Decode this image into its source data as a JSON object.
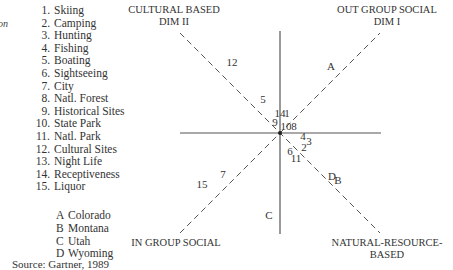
{
  "chart_data": {
    "type": "scatter",
    "title": "",
    "axes": {
      "dim1": {
        "label": "DIM I",
        "positive_end": "OUT GROUP SOCIAL",
        "negative_end": "IN GROUP SOCIAL"
      },
      "dim2": {
        "label": "DIM II",
        "positive_end": "CULTURAL BASED",
        "negative_end": "NATURAL-RESOURCE-BASED"
      }
    },
    "corner_labels": {
      "top_left": [
        "CULTURAL BASED",
        "DIM II"
      ],
      "top_right": [
        "OUT GROUP SOCIAL",
        "DIM I"
      ],
      "bottom_left": [
        "IN GROUP SOCIAL"
      ],
      "bottom_right": [
        "NATURAL-RESOURCE-",
        "BASED"
      ]
    },
    "grid": false,
    "xlim": [
      -1,
      1
    ],
    "ylim": [
      -1,
      1
    ],
    "attributes": [
      {
        "id": "1",
        "label": "Skiing",
        "x": 0.07,
        "y": 0.16
      },
      {
        "id": "2",
        "label": "Camping",
        "x": 0.24,
        "y": -0.18
      },
      {
        "id": "3",
        "label": "Hunting",
        "x": 0.29,
        "y": -0.12
      },
      {
        "id": "4",
        "label": "Fishing",
        "x": 0.23,
        "y": -0.07
      },
      {
        "id": "5",
        "label": "Boating",
        "x": -0.17,
        "y": 0.3
      },
      {
        "id": "6",
        "label": "Sightseeing",
        "x": 0.1,
        "y": -0.22
      },
      {
        "id": "7",
        "label": "City",
        "x": -0.57,
        "y": -0.45
      },
      {
        "id": "8",
        "label": "Natl. Forest",
        "x": 0.14,
        "y": 0.03
      },
      {
        "id": "9",
        "label": "Historical Sites",
        "x": -0.05,
        "y": 0.07
      },
      {
        "id": "10",
        "label": "State Park",
        "x": 0.06,
        "y": 0.03
      },
      {
        "id": "11",
        "label": "Natl. Park",
        "x": 0.16,
        "y": -0.29
      },
      {
        "id": "12",
        "label": "Cultural Sites",
        "x": -0.48,
        "y": 0.67
      },
      {
        "id": "13",
        "label": "Night Life",
        "x": null,
        "y": null
      },
      {
        "id": "14",
        "label": "Receptiveness",
        "x": 0.0,
        "y": 0.16
      },
      {
        "id": "15",
        "label": "Liquor",
        "x": -0.78,
        "y": -0.55
      }
    ],
    "states": [
      {
        "id": "A",
        "label": "Colorado",
        "x": 0.51,
        "y": 0.63
      },
      {
        "id": "B",
        "label": "Montana",
        "x": 0.58,
        "y": -0.51
      },
      {
        "id": "C",
        "label": "Utah",
        "x": -0.11,
        "y": -0.86
      },
      {
        "id": "D",
        "label": "Wyoming",
        "x": 0.52,
        "y": -0.47
      }
    ],
    "source": "Source: Gartner, 1989"
  },
  "legend": {
    "cut_label": "on",
    "attributes": [
      {
        "num": "1.",
        "label": "Skiing"
      },
      {
        "num": "2.",
        "label": "Camping"
      },
      {
        "num": "3.",
        "label": "Hunting"
      },
      {
        "num": "4.",
        "label": "Fishing"
      },
      {
        "num": "5.",
        "label": "Boating"
      },
      {
        "num": "6.",
        "label": "Sightseeing"
      },
      {
        "num": "7.",
        "label": "City"
      },
      {
        "num": "8.",
        "label": "Natl. Forest"
      },
      {
        "num": "9.",
        "label": "Historical Sites"
      },
      {
        "num": "10.",
        "label": "State Park"
      },
      {
        "num": "11.",
        "label": "Natl. Park"
      },
      {
        "num": "12.",
        "label": "Cultural Sites"
      },
      {
        "num": "13.",
        "label": "Night Life"
      },
      {
        "num": "14.",
        "label": "Receptiveness"
      },
      {
        "num": "15.",
        "label": "Liquor"
      }
    ],
    "states": [
      {
        "code": "A",
        "label": "Colorado"
      },
      {
        "code": "B",
        "label": "Montana"
      },
      {
        "code": "C",
        "label": "Utah"
      },
      {
        "code": "D",
        "label": "Wyoming"
      }
    ]
  },
  "source": "Source: Gartner, 1989"
}
